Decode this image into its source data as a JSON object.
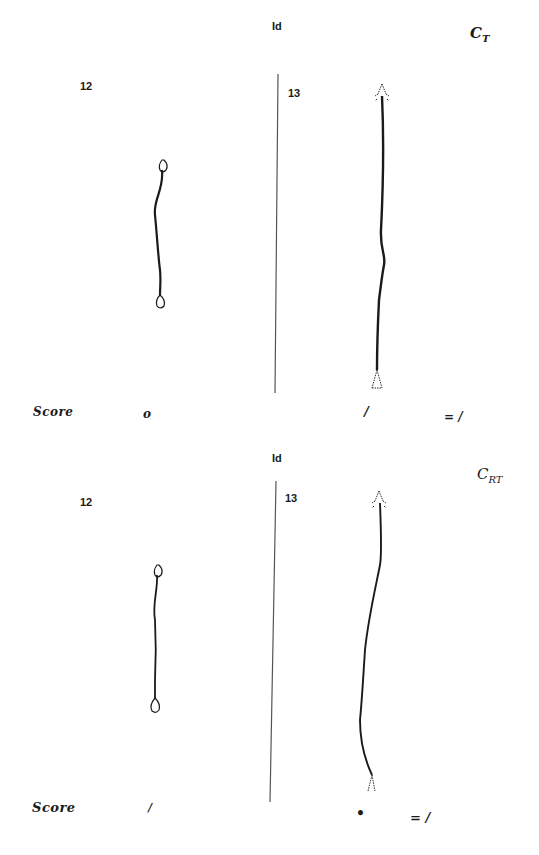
{
  "panels": [
    {
      "id_label": "Id",
      "condition": {
        "main": "C",
        "sub": "T"
      },
      "left_item": {
        "number": "12",
        "score": "o"
      },
      "right_item": {
        "number": "13",
        "score": "/"
      },
      "score_label": "Score",
      "total": "= /"
    },
    {
      "id_label": "Id",
      "condition": {
        "main": "C",
        "sub": "RT"
      },
      "left_item": {
        "number": "12",
        "score": "/"
      },
      "right_item": {
        "number": "13",
        "score": "•"
      },
      "score_label": "Score",
      "total": "= /"
    }
  ],
  "colors": {
    "ink": "#1a1a1a",
    "divider": "#555555",
    "background": "#ffffff"
  }
}
